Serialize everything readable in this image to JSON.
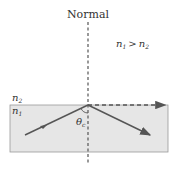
{
  "diagram": {
    "normal_label": "Normal",
    "condition": {
      "n1": "n",
      "sub1": "1",
      "op": ">",
      "n2": "n",
      "sub2": "2"
    },
    "medium_top": {
      "letter": "n",
      "sub": "2"
    },
    "medium_bottom": {
      "letter": "n",
      "sub": "1"
    },
    "angle_label": {
      "letter": "θ",
      "sub": "c"
    },
    "colors": {
      "line": "#555555",
      "medium_fill": "#e6e6e6",
      "medium_border": "#9a9a9a"
    }
  }
}
